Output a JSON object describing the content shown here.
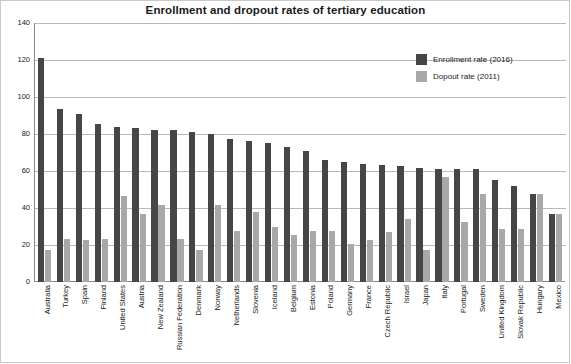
{
  "chart_data": {
    "type": "bar",
    "title": "Enrollment and dropout rates of tertiary education",
    "xlabel": "",
    "ylabel": "",
    "ylim": [
      0,
      140
    ],
    "yticks": [
      0,
      20,
      40,
      60,
      80,
      100,
      120,
      140
    ],
    "grid": true,
    "legend_position": "top-right",
    "categories": [
      "Australia",
      "Turkey",
      "Spain",
      "Finland",
      "United States",
      "Austria",
      "New Zealand",
      "Russian Federation",
      "Denmark",
      "Norway",
      "Netherlands",
      "Slovenia",
      "Iceland",
      "Belgium",
      "Estonia",
      "Poland",
      "Germany",
      "France",
      "Czech Republic",
      "Israel",
      "Japan",
      "Italy",
      "Portugal",
      "Sweden",
      "United Kingdom",
      "Slovak Republic",
      "Hungary",
      "Mexico"
    ],
    "series": [
      {
        "name": "Enrollment rate (2016)",
        "color": "#464646",
        "values": [
          121,
          93.5,
          91,
          85.5,
          84,
          83,
          82,
          82,
          81,
          80,
          77.5,
          76,
          75,
          73,
          71,
          66,
          65,
          64,
          63.5,
          62.5,
          61.5,
          61,
          61,
          61,
          55,
          52,
          47.5,
          37
        ]
      },
      {
        "name": "Dopout rate (2011)",
        "color": "#a8a8a8",
        "values": [
          17.5,
          23.5,
          22.5,
          23,
          46.5,
          36.5,
          41.5,
          23,
          17.5,
          41.5,
          27.5,
          38,
          29.5,
          25.5,
          27.5,
          27.5,
          20.5,
          22.5,
          27,
          34,
          17.5,
          57,
          32.5,
          47.5,
          28.5,
          28.5,
          47.5,
          36.5
        ]
      }
    ]
  },
  "legend": {
    "items": [
      {
        "label": "Enrollment rate (2016)",
        "color": "#464646"
      },
      {
        "label": "Dopout rate (2011)",
        "color": "#a8a8a8"
      }
    ]
  }
}
